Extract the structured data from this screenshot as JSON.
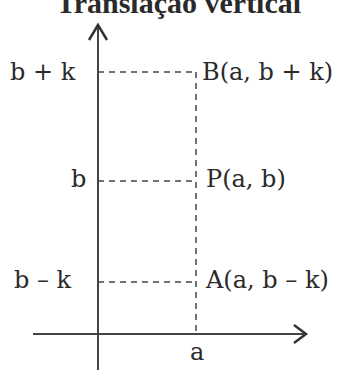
{
  "title": "Translação vertical",
  "axes": {
    "x_label": "a"
  },
  "levels": [
    {
      "tick": "b + k",
      "point": "B(a, b + k)"
    },
    {
      "tick": "b",
      "point": "P(a, b)"
    },
    {
      "tick": "b – k",
      "point": "A(a, b – k)"
    }
  ],
  "colors": {
    "ink": "#2a2a2a",
    "background": "#ffffff"
  }
}
